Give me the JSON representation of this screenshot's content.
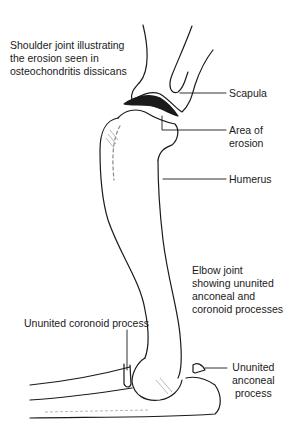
{
  "figure": {
    "title_caption": "Shoulder joint illustrating\nthe erosion seen in\nosteochondritis dissicans",
    "elbow_caption": "Elbow joint\nshowing ununited\nanconeal and\ncoronoid processes",
    "labels": {
      "scapula": "Scapula",
      "area_of_erosion": "Area of\nerosion",
      "humerus": "Humerus",
      "ununited_coronoid": "Ununited coronoid process",
      "ununited_anconeal": "Ununited\nanconeal\nprocess"
    },
    "colors": {
      "ink": "#1a1a1a",
      "background": "#ffffff",
      "hatch": "#888888"
    }
  }
}
